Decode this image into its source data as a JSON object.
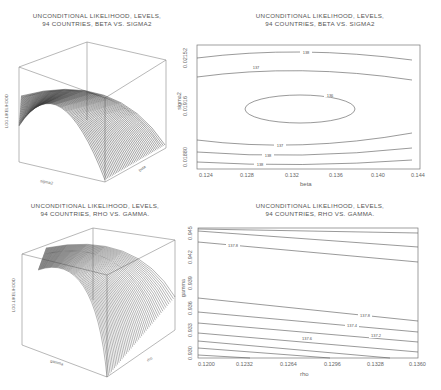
{
  "panels": {
    "top_left": {
      "title_line1": "UNCONDITIONAL LIKELIHOOD, LEVELS,",
      "title_line2": "94 COUNTRIES, BETA VS. SIGMA2",
      "zlabel": "LOG-LIKELIHOOD",
      "xlabel": "sigma2",
      "ylabel": "beta"
    },
    "top_right": {
      "title_line1": "UNCONDITIONAL LIKELIHOOD, LEVELS,",
      "title_line2": "94 COUNTRIES, BETA VS. SIGMA2",
      "xlabel": "beta",
      "ylabel": "sigma2",
      "xticks": [
        "0.124",
        "0.128",
        "0.132",
        "0.136",
        "0.140",
        "0.144"
      ],
      "yticks": [
        "0.01880",
        "0.01916",
        "0.02152"
      ]
    },
    "bottom_left": {
      "title_line1": "UNCONDITIONAL LIKELIHOOD, LEVELS,",
      "title_line2": "94 COUNTRIES, RHO VS. GAMMA.",
      "zlabel": "LOG-LIKELIHOOD",
      "xlabel": "gamma",
      "ylabel": "rho"
    },
    "bottom_right": {
      "title_line1": "UNCONDITIONAL LIKELIHOOD, LEVELS,",
      "title_line2": "94 COUNTRIES, RHO VS. GAMMA.",
      "xlabel": "rho",
      "ylabel": "gamma",
      "xticks": [
        "0.1200",
        "0.1232",
        "0.1264",
        "0.1296",
        "0.1328",
        "0.1360"
      ],
      "yticks": [
        "0.930",
        "0.933",
        "0.936",
        "0.939",
        "0.942",
        "0.945"
      ]
    }
  },
  "chart_data": [
    {
      "type": "surface",
      "title": "UNCONDITIONAL LIKELIHOOD, LEVELS, 94 COUNTRIES, BETA VS. SIGMA2",
      "xlabel": "sigma2",
      "ylabel": "beta",
      "zlabel": "LOG-LIKELIHOOD",
      "description": "3D wireframe surface, concave dome peaking near beta≈0.134, sigma2≈0.0195"
    },
    {
      "type": "contour",
      "title": "UNCONDITIONAL LIKELIHOOD, LEVELS, 94 COUNTRIES, BETA VS. SIGMA2",
      "xlabel": "beta",
      "ylabel": "sigma2",
      "xlim": [
        0.122,
        0.144
      ],
      "x_ticks": [
        0.124,
        0.128,
        0.132,
        0.136,
        0.14,
        0.144
      ],
      "y_ticks": [
        0.0188,
        0.01916,
        0.02152
      ],
      "contour_levels": [
        138,
        137,
        136,
        137,
        138,
        138
      ],
      "max_region": {
        "beta": 0.134,
        "sigma2": 0.0195
      }
    },
    {
      "type": "surface",
      "title": "UNCONDITIONAL LIKELIHOOD, LEVELS, 94 COUNTRIES, RHO VS. GAMMA.",
      "xlabel": "gamma",
      "ylabel": "rho",
      "zlabel": "LOG-LIKELIHOOD",
      "description": "3D wireframe surface, ridge along high gamma, falling off toward low gamma"
    },
    {
      "type": "contour",
      "title": "UNCONDITIONAL LIKELIHOOD, LEVELS, 94 COUNTRIES, RHO VS. GAMMA.",
      "xlabel": "rho",
      "ylabel": "gamma",
      "xlim": [
        0.12,
        0.136
      ],
      "ylim": [
        0.93,
        0.945
      ],
      "x_ticks": [
        0.12,
        0.1232,
        0.1264,
        0.1296,
        0.1328,
        0.136
      ],
      "y_ticks": [
        0.93,
        0.933,
        0.936,
        0.939,
        0.942,
        0.945
      ],
      "contour_levels": [
        137.8,
        137.8,
        137.6,
        137.4,
        137.2
      ]
    }
  ]
}
